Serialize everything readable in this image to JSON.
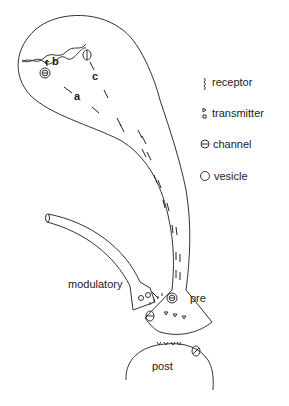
{
  "diagram": {
    "labels": {
      "a": "a",
      "b": "b",
      "c": "c",
      "modulatory": "modulatory",
      "pre": "pre",
      "post": "post"
    },
    "legend": [
      {
        "icon": "receptor-icon",
        "label": "receptor"
      },
      {
        "icon": "transmitter-icon",
        "label": "transmitter"
      },
      {
        "icon": "channel-icon",
        "label": "channel"
      },
      {
        "icon": "vesicle-icon",
        "label": "vesicle"
      }
    ],
    "colors": {
      "line": "#333333",
      "text": "#222222",
      "background": "#ffffff"
    }
  }
}
